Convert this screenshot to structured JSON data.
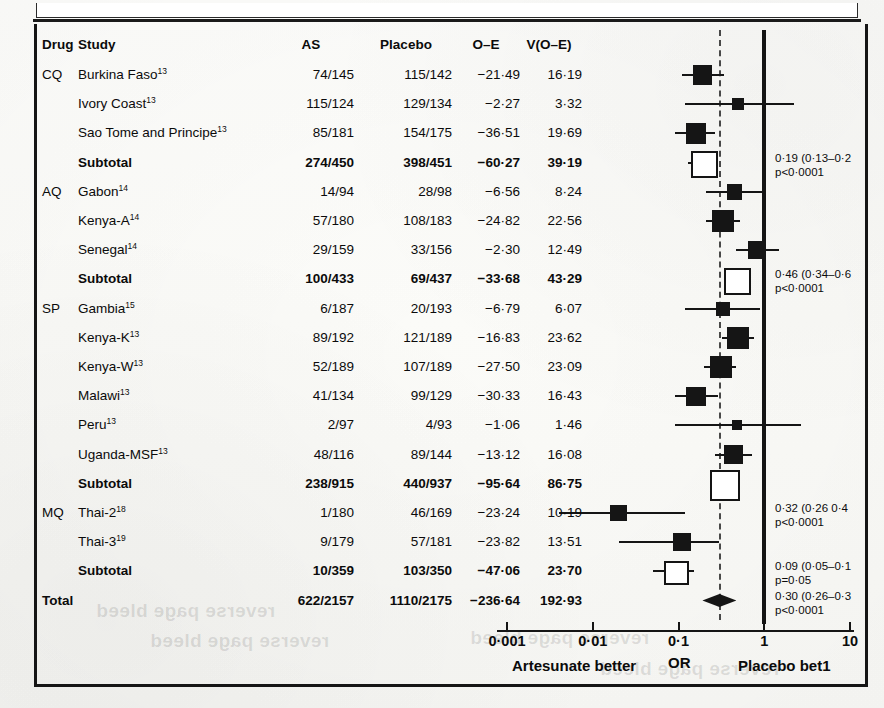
{
  "figure": {
    "type": "forest-plot",
    "columns": [
      "Drug",
      "Study",
      "AS",
      "Placebo",
      "O–E",
      "V(O–E)"
    ]
  },
  "chart_data": {
    "type": "forest",
    "title": "",
    "xlabel": "OR",
    "xscale": "log",
    "xlim": [
      0.001,
      10
    ],
    "ticks": [
      "0·001",
      "0·01",
      "0·1",
      "1",
      "10"
    ],
    "tick_values": [
      0.001,
      0.01,
      0.1,
      1,
      10
    ],
    "null_line": 1,
    "reference_line": 0.3,
    "left_axis_label": "Artesunate better",
    "center_axis_label": "OR",
    "right_axis_label": "Placebo bet1",
    "grid": false,
    "legend": "",
    "rows": [
      {
        "drug": "CQ",
        "study": "Burkina Faso",
        "ref": "13",
        "as": "74/145",
        "placebo": "115/142",
        "oe": "−21·49",
        "voe": "16·19",
        "kind": "study",
        "or": 0.19,
        "lo": 0.11,
        "hi": 0.34
      },
      {
        "drug": "",
        "study": "Ivory Coast",
        "ref": "13",
        "as": "115/124",
        "placebo": "129/134",
        "oe": "−2·27",
        "voe": "3·32",
        "kind": "study",
        "or": 0.5,
        "lo": 0.12,
        "hi": 2.2
      },
      {
        "drug": "",
        "study": "Sao Tome and Principe",
        "ref": "13",
        "as": "85/181",
        "placebo": "154/175",
        "oe": "−36·51",
        "voe": "19·69",
        "kind": "study",
        "or": 0.16,
        "lo": 0.09,
        "hi": 0.27
      },
      {
        "drug": "",
        "study": "Subtotal",
        "ref": "",
        "as": "274/450",
        "placebo": "398/451",
        "oe": "−60·27",
        "voe": "39·19",
        "kind": "subtotal",
        "or": 0.19,
        "lo": 0.13,
        "hi": 0.27,
        "annotation": [
          "0·19 (0·13–0·2",
          "p<0·0001"
        ]
      },
      {
        "drug": "AQ",
        "study": "Gabon",
        "ref": "14",
        "as": "14/94",
        "placebo": "28/98",
        "oe": "−6·56",
        "voe": "8·24",
        "kind": "study",
        "or": 0.45,
        "lo": 0.21,
        "hi": 1.0
      },
      {
        "drug": "",
        "study": "Kenya-A",
        "ref": "14",
        "as": "57/180",
        "placebo": "108/183",
        "oe": "−24·82",
        "voe": "22·56",
        "kind": "study",
        "or": 0.33,
        "lo": 0.21,
        "hi": 0.52
      },
      {
        "drug": "",
        "study": "Senegal",
        "ref": "14",
        "as": "29/159",
        "placebo": "33/156",
        "oe": "−2·30",
        "voe": "12·49",
        "kind": "study",
        "or": 0.83,
        "lo": 0.47,
        "hi": 1.5
      },
      {
        "drug": "",
        "study": "Subtotal",
        "ref": "",
        "as": "100/433",
        "placebo": "69/437",
        "oe": "−33·68",
        "voe": "43·29",
        "kind": "subtotal",
        "or": 0.46,
        "lo": 0.34,
        "hi": 0.62,
        "annotation": [
          "0·46 (0·34–0·6",
          "p<0·0001"
        ]
      },
      {
        "drug": "SP",
        "study": "Gambia",
        "ref": "15",
        "as": "6/187",
        "placebo": "20/193",
        "oe": "−6·79",
        "voe": "6·07",
        "kind": "study",
        "or": 0.33,
        "lo": 0.12,
        "hi": 0.9
      },
      {
        "drug": "",
        "study": "Kenya-K",
        "ref": "13",
        "as": "89/192",
        "placebo": "121/189",
        "oe": "−16·83",
        "voe": "23·62",
        "kind": "study",
        "or": 0.49,
        "lo": 0.32,
        "hi": 0.76
      },
      {
        "drug": "",
        "study": "Kenya-W",
        "ref": "13",
        "as": "52/189",
        "placebo": "107/189",
        "oe": "−27·50",
        "voe": "23·09",
        "kind": "study",
        "or": 0.31,
        "lo": 0.2,
        "hi": 0.47
      },
      {
        "drug": "",
        "study": "Malawi",
        "ref": "13",
        "as": "41/134",
        "placebo": "99/129",
        "oe": "−30·33",
        "voe": "16·43",
        "kind": "study",
        "or": 0.16,
        "lo": 0.09,
        "hi": 0.29
      },
      {
        "drug": "",
        "study": "Peru",
        "ref": "13",
        "as": "2/97",
        "placebo": "4/93",
        "oe": "−1·06",
        "voe": "1·46",
        "kind": "study",
        "or": 0.48,
        "lo": 0.09,
        "hi": 2.7
      },
      {
        "drug": "",
        "study": "Uganda-MSF",
        "ref": "13",
        "as": "48/116",
        "placebo": "89/144",
        "oe": "−13·12",
        "voe": "16·08",
        "kind": "study",
        "or": 0.44,
        "lo": 0.27,
        "hi": 0.72
      },
      {
        "drug": "",
        "study": "Subtotal",
        "ref": "",
        "as": "238/915",
        "placebo": "440/937",
        "oe": "−95·64",
        "voe": "86·75",
        "kind": "subtotal",
        "or": 0.33,
        "lo": 0.27,
        "hi": 0.41
      },
      {
        "drug": "MQ",
        "study": "Thai-2",
        "ref": "18",
        "as": "1/180",
        "placebo": "46/169",
        "oe": "−23·24",
        "voe": "10·19",
        "kind": "study",
        "or": 0.02,
        "lo": 0.004,
        "hi": 0.12,
        "annotation": [
          "0·32 (0·26 0·4",
          "p<0·0001"
        ]
      },
      {
        "drug": "",
        "study": "Thai-3",
        "ref": "19",
        "as": "9/179",
        "placebo": "57/181",
        "oe": "−23·82",
        "voe": "13·51",
        "kind": "study",
        "or": 0.11,
        "lo": 0.02,
        "hi": 0.3
      },
      {
        "drug": "",
        "study": "Subtotal",
        "ref": "",
        "as": "10/359",
        "placebo": "103/350",
        "oe": "−47·06",
        "voe": "23·70",
        "kind": "subtotal",
        "or": 0.09,
        "lo": 0.05,
        "hi": 0.15,
        "annotation": [
          "0·09 (0·05–0·1",
          "p=0·05"
        ]
      },
      {
        "drug": "Total",
        "study": "",
        "ref": "",
        "as": "622/2157",
        "placebo": "1110/2175",
        "oe": "−236·64",
        "voe": "192·93",
        "kind": "total",
        "or": 0.3,
        "lo": 0.26,
        "hi": 0.35,
        "annotation": [
          "0·30 (0·26–0·3",
          "p<0·0001"
        ]
      }
    ]
  },
  "ghost_text": {
    "line1": "reverse page bleed",
    "line2": "reverse page bleed",
    "line3": "reverse page bleed",
    "line4": "reverse page bleed"
  }
}
